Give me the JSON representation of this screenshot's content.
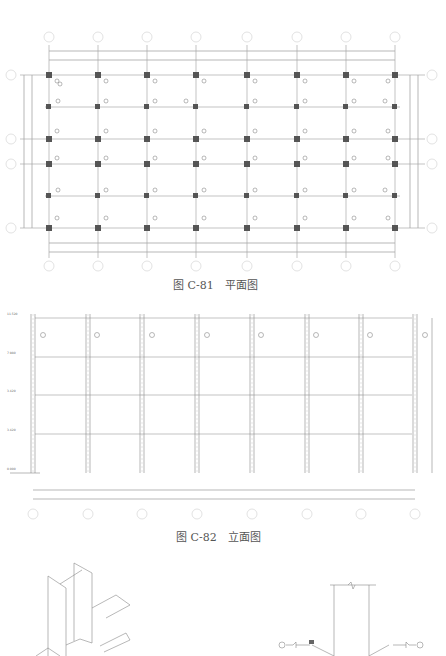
{
  "plan": {
    "caption": "图 C-81　平面图",
    "axis_labels_top": [
      "1",
      "2",
      "3",
      "4",
      "5",
      "6",
      "7",
      "8"
    ],
    "axis_labels_bottom": [
      "1",
      "2",
      "3",
      "4",
      "5",
      "6",
      "7",
      "8"
    ],
    "axis_labels_left": [
      "D",
      "C",
      "B",
      "A"
    ],
    "axis_labels_right": [
      "D",
      "C",
      "B",
      "A"
    ],
    "beam_label": "GL1",
    "column_label": "GZ1"
  },
  "elevation": {
    "caption": "图 C-82　立面图",
    "levels": [
      "11.520",
      "7.980",
      "3.420",
      "3.420",
      "0.000"
    ],
    "axis_labels_bottom": [
      "1",
      "2",
      "3",
      "4",
      "5",
      "6",
      "7",
      "8"
    ],
    "beam_label": "GL1",
    "column_label": "GZ1"
  },
  "detail": {
    "left_view": "isometric-column-beam-joint",
    "right_view": "weld-detail-elevation"
  }
}
